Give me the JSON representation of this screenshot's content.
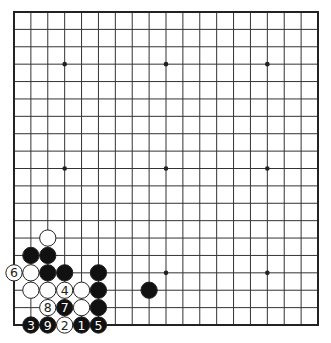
{
  "diagram": {
    "type": "go-board",
    "size": 19,
    "origin_px": {
      "x": 14,
      "y": 12
    },
    "end_px": {
      "x": 318,
      "y": 325
    },
    "colors": {
      "background": "#ffffff",
      "line": "#333333",
      "border": "#222222",
      "black_stone": "#111111",
      "white_stone": "#ffffff",
      "stone_outline": "#222222",
      "black_label": "#ffffff",
      "white_label": "#222222"
    },
    "hoshi": [
      [
        3,
        3
      ],
      [
        9,
        3
      ],
      [
        15,
        3
      ],
      [
        3,
        9
      ],
      [
        9,
        9
      ],
      [
        15,
        9
      ],
      [
        3,
        15
      ],
      [
        9,
        15
      ],
      [
        15,
        15
      ]
    ],
    "stones": [
      {
        "col": 2,
        "row": 13,
        "color": "white",
        "label": ""
      },
      {
        "col": 1,
        "row": 14,
        "color": "black",
        "label": ""
      },
      {
        "col": 2,
        "row": 14,
        "color": "black",
        "label": ""
      },
      {
        "col": 0,
        "row": 15,
        "color": "white",
        "label": "6"
      },
      {
        "col": 1,
        "row": 15,
        "color": "white",
        "label": ""
      },
      {
        "col": 2,
        "row": 15,
        "color": "black",
        "label": ""
      },
      {
        "col": 3,
        "row": 15,
        "color": "black",
        "label": ""
      },
      {
        "col": 5,
        "row": 15,
        "color": "black",
        "label": ""
      },
      {
        "col": 1,
        "row": 16,
        "color": "white",
        "label": ""
      },
      {
        "col": 2,
        "row": 16,
        "color": "white",
        "label": ""
      },
      {
        "col": 3,
        "row": 16,
        "color": "white",
        "label": "4"
      },
      {
        "col": 4,
        "row": 16,
        "color": "white",
        "label": ""
      },
      {
        "col": 5,
        "row": 16,
        "color": "black",
        "label": ""
      },
      {
        "col": 8,
        "row": 16,
        "color": "black",
        "label": ""
      },
      {
        "col": 2,
        "row": 17,
        "color": "white",
        "label": "8"
      },
      {
        "col": 3,
        "row": 17,
        "color": "black",
        "label": "7"
      },
      {
        "col": 4,
        "row": 17,
        "color": "white",
        "label": ""
      },
      {
        "col": 5,
        "row": 17,
        "color": "black",
        "label": ""
      },
      {
        "col": 1,
        "row": 18,
        "color": "black",
        "label": "3"
      },
      {
        "col": 2,
        "row": 18,
        "color": "black",
        "label": "9"
      },
      {
        "col": 3,
        "row": 18,
        "color": "white",
        "label": "2"
      },
      {
        "col": 4,
        "row": 18,
        "color": "black",
        "label": "1"
      },
      {
        "col": 5,
        "row": 18,
        "color": "black",
        "label": "5"
      }
    ]
  }
}
